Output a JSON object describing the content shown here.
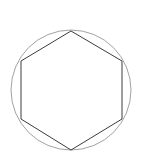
{
  "figure": {
    "title": "",
    "background_color": "#ffffff",
    "width": 143,
    "height": 161
  },
  "chart_data": {
    "type": "scatter",
    "title": "",
    "subtitle": "",
    "xlabel": "",
    "ylabel": "",
    "xlim": [
      0,
      143
    ],
    "ylim": [
      0,
      161
    ],
    "grid": false,
    "legend": "none",
    "annotations": [],
    "shapes": [
      {
        "name": "circumscribed-circle",
        "kind": "circle",
        "center": [
          71,
          90
        ],
        "radius": 60,
        "stroke": "#8a8a8a",
        "stroke_width": 0.8,
        "fill": "none"
      },
      {
        "name": "inscribed-hexagon",
        "kind": "polygon",
        "sides": 6,
        "center": [
          71,
          90
        ],
        "circumradius": 60,
        "orientation": "pointy-top",
        "points": [
          [
            71,
            31
          ],
          [
            122,
            61
          ],
          [
            122,
            119
          ],
          [
            71,
            150
          ],
          [
            21,
            119
          ],
          [
            21,
            61
          ]
        ],
        "stroke": "#3c3c3c",
        "stroke_width": 1,
        "fill": "none"
      }
    ],
    "categories": [
      "top",
      "upper-right",
      "lower-right",
      "bottom",
      "lower-left",
      "upper-left"
    ],
    "x": [
      71,
      122,
      122,
      71,
      21,
      21
    ],
    "y": [
      31,
      61,
      119,
      150,
      119,
      61
    ]
  }
}
